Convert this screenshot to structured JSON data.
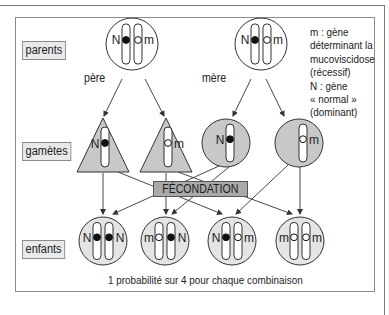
{
  "labels": {
    "parents": "parents",
    "gametes": "gamètes",
    "enfants": "enfants",
    "pere": "père",
    "mere": "mère",
    "fecondation": "FÉCONDATION",
    "footer": "1 probabilité sur 4 pour chaque combinaison"
  },
  "legend": [
    "m : gène",
    "déterminant la",
    "mucoviscidose",
    "(récessif)",
    "N : gène",
    "« normal »",
    "(dominant)"
  ],
  "colors": {
    "gamete_fill": "#c8c8c8",
    "child_fill": "#e4e4e4",
    "stroke": "#333333",
    "fecondation_fill": "#a9a9a9"
  },
  "parents": [
    {
      "name": "père",
      "left_allele": "N",
      "right_allele": "m"
    },
    {
      "name": "mère",
      "left_allele": "N",
      "right_allele": "m"
    }
  ],
  "gametes": [
    {
      "from": "père",
      "shape": "triangle",
      "allele": "N"
    },
    {
      "from": "père",
      "shape": "triangle",
      "allele": "m"
    },
    {
      "from": "mère",
      "shape": "circle",
      "allele": "N"
    },
    {
      "from": "mère",
      "shape": "circle",
      "allele": "m"
    }
  ],
  "enfants": [
    {
      "left_allele": "N",
      "right_allele": "N"
    },
    {
      "left_allele": "m",
      "right_allele": "N"
    },
    {
      "left_allele": "N",
      "right_allele": "m"
    },
    {
      "left_allele": "m",
      "right_allele": "m"
    }
  ]
}
